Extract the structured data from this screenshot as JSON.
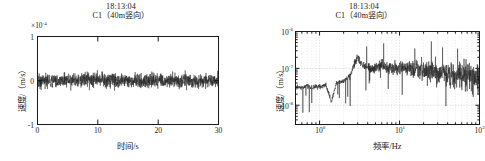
{
  "figure": {
    "background": "#ffffff",
    "line_color": "#262626",
    "axis_color": "#1a1a1a",
    "grid_color": "#bfbfbf"
  },
  "panels": [
    {
      "id": "time-history",
      "title_time": "18:13:04",
      "title_name": "C1（40m竖向）",
      "multiplier": "×10",
      "multiplier_exp": "-4",
      "xlabel": "时间/s",
      "ylabel": "速度/（m/s）",
      "xticks": [
        "0",
        "10",
        "20",
        "30"
      ],
      "yticks": [
        "1",
        "0",
        "-1"
      ]
    },
    {
      "id": "spectrum",
      "title_time": "18:13:04",
      "title_name": "C1（40m竖向）",
      "xlabel": "频率/Hz",
      "ylabel": "速度/（m/s）",
      "xticks": [
        "10",
        "10",
        "10"
      ],
      "xtick_exps": [
        "0",
        "1",
        "2"
      ],
      "yticks": [
        "10",
        "10",
        "10"
      ],
      "ytick_exps": [
        "-6",
        "-7",
        "-8"
      ]
    }
  ],
  "chart_data": [
    {
      "type": "line",
      "id": "time-history",
      "title": "18:13:04  C1（40m竖向）",
      "xlabel": "时间/s",
      "ylabel": "速度/（m/s）",
      "y_multiplier": 0.0001,
      "xlim": [
        0,
        30
      ],
      "ylim": [
        -1,
        1
      ],
      "xticks": [
        0,
        10,
        20,
        30
      ],
      "yticks": [
        -1,
        0,
        1
      ],
      "grid": false,
      "legend": null,
      "description": "Dense broadband random vibration velocity trace centred on zero, roughly stationary for the whole 30 s record.",
      "series": [
        {
          "name": "C1 vertical velocity",
          "color": "#262626",
          "mean": 0.0,
          "rms_amplitude": 0.12,
          "peak_amplitude": 0.3,
          "samples_hint": 1500,
          "envelope_x": [
            0,
            1,
            2,
            3,
            4,
            5,
            6,
            7,
            8,
            9,
            10,
            11,
            12,
            13,
            14,
            15,
            16,
            17,
            18,
            19,
            20,
            21,
            22,
            23,
            24,
            25,
            26,
            27,
            28,
            29,
            30
          ],
          "envelope_upper": [
            0.26,
            0.23,
            0.22,
            0.24,
            0.23,
            0.22,
            0.25,
            0.24,
            0.22,
            0.23,
            0.24,
            0.22,
            0.23,
            0.25,
            0.22,
            0.23,
            0.24,
            0.22,
            0.23,
            0.24,
            0.23,
            0.22,
            0.24,
            0.23,
            0.22,
            0.24,
            0.23,
            0.22,
            0.23,
            0.24,
            0.22
          ],
          "envelope_lower": [
            -0.3,
            -0.24,
            -0.22,
            -0.25,
            -0.23,
            -0.22,
            -0.24,
            -0.23,
            -0.22,
            -0.24,
            -0.23,
            -0.22,
            -0.24,
            -0.23,
            -0.22,
            -0.25,
            -0.23,
            -0.22,
            -0.24,
            -0.23,
            -0.22,
            -0.24,
            -0.23,
            -0.22,
            -0.24,
            -0.23,
            -0.22,
            -0.24,
            -0.23,
            -0.22,
            -0.24
          ]
        }
      ]
    },
    {
      "type": "line",
      "id": "spectrum",
      "title": "18:13:04  C1（40m竖向）",
      "xlabel": "频率/Hz",
      "ylabel": "速度/（m/s）",
      "xscale": "log",
      "yscale": "log",
      "xlim": [
        0.5,
        100
      ],
      "ylim": [
        3e-09,
        1e-06
      ],
      "xticks": [
        1,
        10,
        100
      ],
      "yticks": [
        1e-08,
        1e-07,
        1e-06
      ],
      "grid": true,
      "legend": null,
      "description": "Fourier amplitude spectrum: flat near 3e-8 below 2 Hz, a clear peak near 3 Hz reaching about 2e-7, then a broad plateau near 1e-7 from 4 to 20 Hz that becomes increasingly spiky and slowly decays toward 100 Hz.",
      "series": [
        {
          "name": "C1 vertical velocity spectrum",
          "color": "#262626",
          "x": [
            0.5,
            0.6,
            0.7,
            0.8,
            0.9,
            1.0,
            1.2,
            1.4,
            1.6,
            1.8,
            2.0,
            2.4,
            2.8,
            3.0,
            3.3,
            3.6,
            4.0,
            4.5,
            5.0,
            6.0,
            7.0,
            8.0,
            9.0,
            10.0,
            12.0,
            14.0,
            16.0,
            18.0,
            20.0,
            25.0,
            30.0,
            40.0,
            50.0,
            60.0,
            70.0,
            80.0,
            90.0,
            100.0
          ],
          "y": [
            3.2e-08,
            3e-08,
            3.4e-08,
            2.9e-08,
            3.3e-08,
            3.1e-08,
            3.6e-08,
            1.2e-08,
            3.8e-08,
            4.2e-08,
            4.6e-08,
            6e-08,
            1.6e-07,
            1.9e-07,
            1.4e-07,
            1.2e-07,
            1.1e-07,
            9e-08,
            1e-07,
            1.2e-07,
            1e-07,
            1.1e-07,
            9.5e-08,
            1e-07,
            1.1e-07,
            9e-08,
            1e-07,
            9e-08,
            8.5e-08,
            9e-08,
            8e-08,
            7e-08,
            6.5e-08,
            6e-08,
            6.5e-08,
            5.5e-08,
            6e-08,
            5e-08
          ],
          "spike_peaks_x": [
            20.5,
            23,
            28,
            36,
            44,
            52,
            58,
            66,
            74,
            82,
            88,
            95
          ],
          "spike_peaks_y": [
            2.6e-07,
            2.2e-07,
            2e-07,
            2.4e-07,
            2.1e-07,
            2.3e-07,
            1.9e-07,
            2.2e-07,
            2e-07,
            2.3e-07,
            2.1e-07,
            2.4e-07
          ]
        }
      ]
    }
  ]
}
